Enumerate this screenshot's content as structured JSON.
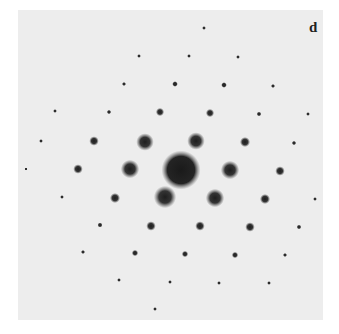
{
  "figure": {
    "panel_label": "d",
    "colors": {
      "background_outer": "#ffffff",
      "panel_background": "#ededed",
      "spot": "#2a2a2a"
    },
    "center": {
      "x": 181,
      "y": 170,
      "r": 17
    },
    "spots": [
      {
        "x": 204,
        "y": 28,
        "r": 1.2
      },
      {
        "x": 139,
        "y": 56,
        "r": 1.2
      },
      {
        "x": 189,
        "y": 56,
        "r": 1.2
      },
      {
        "x": 238,
        "y": 57,
        "r": 1.2
      },
      {
        "x": 55,
        "y": 111,
        "r": 1.2
      },
      {
        "x": 124,
        "y": 84,
        "r": 1.3
      },
      {
        "x": 175,
        "y": 84,
        "r": 1.8
      },
      {
        "x": 224,
        "y": 85,
        "r": 1.8
      },
      {
        "x": 273,
        "y": 86,
        "r": 1.3
      },
      {
        "x": 109,
        "y": 112,
        "r": 1.4
      },
      {
        "x": 160,
        "y": 112,
        "r": 2.6
      },
      {
        "x": 210,
        "y": 113,
        "r": 2.6
      },
      {
        "x": 259,
        "y": 114,
        "r": 1.5
      },
      {
        "x": 308,
        "y": 114,
        "r": 1.2
      },
      {
        "x": 41,
        "y": 141,
        "r": 1.2
      },
      {
        "x": 94,
        "y": 141,
        "r": 3.0
      },
      {
        "x": 145,
        "y": 142,
        "r": 5.5
      },
      {
        "x": 196,
        "y": 141,
        "r": 5.5
      },
      {
        "x": 245,
        "y": 142,
        "r": 3.2
      },
      {
        "x": 294,
        "y": 143,
        "r": 1.4
      },
      {
        "x": 26,
        "y": 169,
        "r": 1.0
      },
      {
        "x": 78,
        "y": 169,
        "r": 3.0
      },
      {
        "x": 130,
        "y": 169,
        "r": 5.8
      },
      {
        "x": 230,
        "y": 170,
        "r": 5.8
      },
      {
        "x": 280,
        "y": 171,
        "r": 3.0
      },
      {
        "x": 62,
        "y": 197,
        "r": 1.2
      },
      {
        "x": 115,
        "y": 198,
        "r": 3.2
      },
      {
        "x": 165,
        "y": 197,
        "r": 7.0
      },
      {
        "x": 215,
        "y": 198,
        "r": 5.8
      },
      {
        "x": 265,
        "y": 199,
        "r": 3.2
      },
      {
        "x": 315,
        "y": 199,
        "r": 1.2
      },
      {
        "x": 100,
        "y": 225,
        "r": 1.6
      },
      {
        "x": 151,
        "y": 226,
        "r": 3.0
      },
      {
        "x": 200,
        "y": 226,
        "r": 3.0
      },
      {
        "x": 250,
        "y": 227,
        "r": 3.0
      },
      {
        "x": 299,
        "y": 227,
        "r": 1.5
      },
      {
        "x": 83,
        "y": 252,
        "r": 1.3
      },
      {
        "x": 135,
        "y": 253,
        "r": 2.0
      },
      {
        "x": 185,
        "y": 254,
        "r": 2.0
      },
      {
        "x": 235,
        "y": 255,
        "r": 2.0
      },
      {
        "x": 285,
        "y": 255,
        "r": 1.3
      },
      {
        "x": 119,
        "y": 280,
        "r": 1.2
      },
      {
        "x": 170,
        "y": 282,
        "r": 1.2
      },
      {
        "x": 219,
        "y": 283,
        "r": 1.2
      },
      {
        "x": 269,
        "y": 283,
        "r": 1.2
      },
      {
        "x": 155,
        "y": 309,
        "r": 1.2
      }
    ]
  }
}
